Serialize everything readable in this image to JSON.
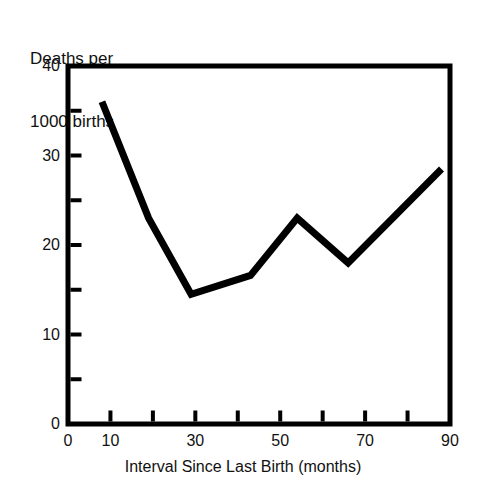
{
  "chart_data": {
    "type": "line",
    "title": "",
    "ylabel": "Deaths per\n1000 births",
    "ylabel_line1": "Deaths per",
    "ylabel_line2": "1000 births",
    "xlabel": "Interval Since Last Birth (months)",
    "xlim": [
      0,
      90
    ],
    "ylim": [
      0,
      40
    ],
    "grid": false,
    "legend": null,
    "x_major_ticks": [
      0,
      10,
      30,
      50,
      70,
      90
    ],
    "x_all_ticks": [
      0,
      10,
      20,
      30,
      40,
      50,
      60,
      70,
      80,
      90
    ],
    "x_tick_labels": [
      "0",
      "10",
      "30",
      "50",
      "70",
      "90"
    ],
    "y_major_ticks": [
      0,
      10,
      20,
      30,
      40
    ],
    "y_all_ticks": [
      0,
      5,
      10,
      15,
      20,
      25,
      30,
      35,
      40
    ],
    "y_tick_labels": [
      "0",
      "10",
      "20",
      "30",
      "40"
    ],
    "line_color": "#000000",
    "line_width_px": 7,
    "series": [
      {
        "name": "Deaths per 1000 births",
        "x": [
          8,
          19,
          29,
          43,
          54,
          66,
          88
        ],
        "values": [
          36,
          23,
          14.5,
          16.6,
          23,
          18,
          28.5
        ]
      }
    ]
  },
  "axes": {
    "frame_color": "#000000",
    "frame_width_px": 5,
    "plot_left_px": 68,
    "plot_right_px": 450,
    "plot_top_px": 66,
    "plot_bottom_px": 424
  }
}
